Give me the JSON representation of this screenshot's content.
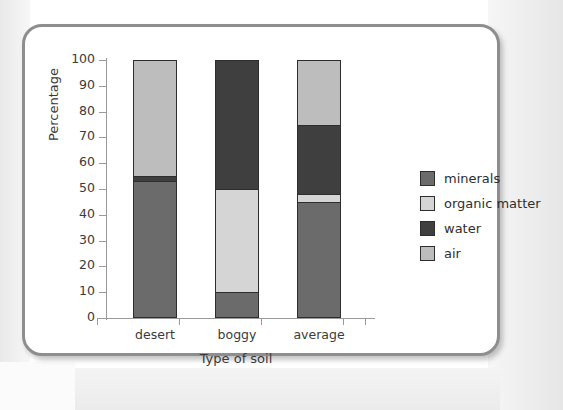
{
  "chart_data": {
    "type": "bar",
    "subtype": "stacked-100-percent",
    "title": "",
    "xlabel": "Type of soil",
    "ylabel": "Percentage",
    "categories": [
      "desert",
      "boggy",
      "average"
    ],
    "ylim": [
      0,
      100
    ],
    "yticks": [
      0,
      10,
      20,
      30,
      40,
      50,
      60,
      70,
      80,
      90,
      100
    ],
    "ytick_labels": [
      "0",
      "10",
      "20",
      "30",
      "40",
      "50",
      "60",
      "70",
      "80",
      "90",
      "100"
    ],
    "grid": false,
    "legend_position": "right",
    "series": [
      {
        "name": "minerals",
        "color": "#6b6b6b",
        "values": [
          53,
          10,
          45
        ]
      },
      {
        "name": "organic matter",
        "color": "#d5d5d5",
        "values": [
          0,
          40,
          3
        ]
      },
      {
        "name": "water",
        "color": "#3f3f3f",
        "values": [
          2,
          50,
          27
        ]
      },
      {
        "name": "air",
        "color": "#bdbdbd",
        "values": [
          45,
          0,
          25
        ]
      }
    ],
    "stacks": {
      "desert": [
        {
          "name": "minerals",
          "from": 0,
          "to": 53,
          "color": "#6b6b6b"
        },
        {
          "name": "water",
          "from": 53,
          "to": 55,
          "color": "#3f3f3f"
        },
        {
          "name": "air",
          "from": 55,
          "to": 100,
          "color": "#bdbdbd"
        }
      ],
      "boggy": [
        {
          "name": "minerals",
          "from": 0,
          "to": 10,
          "color": "#6b6b6b"
        },
        {
          "name": "organic matter",
          "from": 10,
          "to": 50,
          "color": "#d5d5d5"
        },
        {
          "name": "water",
          "from": 50,
          "to": 100,
          "color": "#3f3f3f"
        }
      ],
      "average": [
        {
          "name": "minerals",
          "from": 0,
          "to": 45,
          "color": "#6b6b6b"
        },
        {
          "name": "organic matter",
          "from": 45,
          "to": 48,
          "color": "#d5d5d5"
        },
        {
          "name": "water",
          "from": 48,
          "to": 75,
          "color": "#3f3f3f"
        },
        {
          "name": "air",
          "from": 75,
          "to": 100,
          "color": "#bdbdbd"
        }
      ]
    }
  },
  "legend": {
    "items": [
      {
        "label": "minerals",
        "color": "#6b6b6b"
      },
      {
        "label": "organic matter",
        "color": "#d5d5d5"
      },
      {
        "label": "water",
        "color": "#3f3f3f"
      },
      {
        "label": "air",
        "color": "#bdbdbd"
      }
    ]
  },
  "colors": {
    "minerals": "#6b6b6b",
    "organic_matter": "#d5d5d5",
    "water": "#3f3f3f",
    "air": "#bdbdbd",
    "frame": "#8e8e8e",
    "axis": "#9a9a9a",
    "text": "#3a3a3a"
  }
}
